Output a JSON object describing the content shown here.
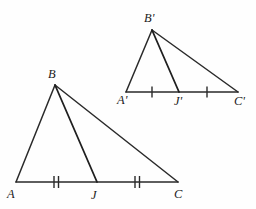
{
  "figure": {
    "type": "geometry-diagram",
    "background_color": "#fefefe",
    "line_color": "#2a2a2a",
    "label_color": "#1b1b1b",
    "triangles": [
      {
        "name": "triangle-ABC",
        "id": "lower",
        "vertices": {
          "A": {
            "label": "A",
            "x": 16,
            "y": 182,
            "label_x": 7,
            "label_y": 198
          },
          "B": {
            "label": "B",
            "x": 55,
            "y": 85,
            "label_x": 48,
            "label_y": 78
          },
          "C": {
            "label": "C",
            "x": 178,
            "y": 182,
            "label_x": 174,
            "label_y": 198
          }
        },
        "cevian_point": {
          "label": "J",
          "x": 97,
          "y": 182,
          "label_x": 91,
          "label_y": 199
        },
        "sides": [
          {
            "name": "side-AB",
            "from": "A",
            "to": "B"
          },
          {
            "name": "side-BC",
            "from": "B",
            "to": "C"
          },
          {
            "name": "side-AC",
            "from": "A",
            "to": "C"
          }
        ],
        "cevian": {
          "name": "cevian-BJ",
          "from": "B",
          "to": "J"
        },
        "tick_marks": [
          {
            "name": "tick-AJ",
            "x": 56,
            "y": 182,
            "count": 2
          },
          {
            "name": "tick-JC",
            "x": 137,
            "y": 182,
            "count": 2
          }
        ]
      },
      {
        "name": "triangle-A-prime-B-prime-C-prime",
        "id": "upper",
        "vertices": {
          "A": {
            "label": "A'",
            "x": 126,
            "y": 92,
            "label_x": 117,
            "label_y": 104
          },
          "B": {
            "label": "B'",
            "x": 152,
            "y": 30,
            "label_x": 144,
            "label_y": 22
          },
          "C": {
            "label": "C'",
            "x": 238,
            "y": 92,
            "label_x": 234,
            "label_y": 105
          }
        },
        "cevian_point": {
          "label": "J'",
          "x": 179,
          "y": 92,
          "label_x": 174,
          "label_y": 105
        },
        "sides": [
          {
            "name": "side-A-prime-B-prime",
            "from": "A",
            "to": "B"
          },
          {
            "name": "side-B-prime-C-prime",
            "from": "B",
            "to": "C"
          },
          {
            "name": "side-A-prime-C-prime",
            "from": "A",
            "to": "C"
          }
        ],
        "cevian": {
          "name": "cevian-B-prime-J-prime",
          "from": "B",
          "to": "J"
        },
        "tick_marks": [
          {
            "name": "tick-A-prime-J-prime",
            "x": 152,
            "y": 92,
            "count": 1
          },
          {
            "name": "tick-J-prime-C-prime",
            "x": 207,
            "y": 92,
            "count": 1
          }
        ]
      }
    ],
    "labels": {
      "A": "A",
      "B": "B",
      "C": "C",
      "J": "J",
      "A_prime": "A'",
      "B_prime": "B'",
      "C_prime": "C'",
      "J_prime": "J'"
    }
  }
}
